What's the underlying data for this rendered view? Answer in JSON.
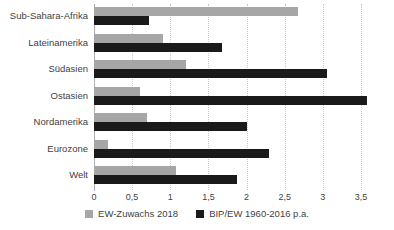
{
  "chart_data": {
    "type": "bar",
    "orientation": "horizontal",
    "title": "",
    "xlabel": "",
    "ylabel": "",
    "xlim": [
      0,
      3.75
    ],
    "xticks": [
      "0",
      "0,5",
      "1",
      "1,5",
      "2",
      "2,5",
      "3",
      "3,5"
    ],
    "xtick_values": [
      0,
      0.5,
      1,
      1.5,
      2,
      2.5,
      3,
      3.5
    ],
    "grid": true,
    "legend_position": "bottom",
    "categories": [
      "Sub-Sahara-Afrika",
      "Lateinamerika",
      "Südasien",
      "Ostasien",
      "Nordamerika",
      "Eurozone",
      "Welt"
    ],
    "series": [
      {
        "name": "EW-Zuwachs 2018",
        "color": "#a6a6a6",
        "values": [
          2.67,
          0.9,
          1.2,
          0.6,
          0.7,
          0.19,
          1.08
        ]
      },
      {
        "name": "BIP/EW 1960-2016 p.a.",
        "color": "#1a1a1a",
        "values": [
          0.72,
          1.68,
          3.06,
          3.58,
          2.0,
          2.29,
          1.87
        ]
      }
    ]
  },
  "legend": {
    "items": [
      {
        "label": "EW-Zuwachs 2018",
        "swatch": "gray"
      },
      {
        "label": "BIP/EW 1960-2016 p.a.",
        "swatch": "black"
      }
    ]
  }
}
